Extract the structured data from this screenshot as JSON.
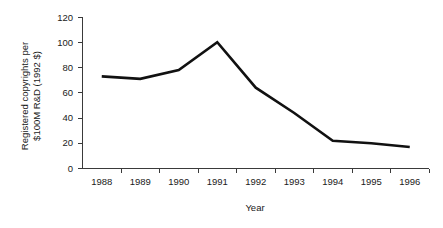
{
  "chart_data": {
    "type": "line",
    "title": "",
    "xlabel": "Year",
    "ylabel": "Registered copyrights per $100M R&D (1992 $)",
    "ylabel_line1": "Registered copyrights per",
    "ylabel_line2": "$100M R&D (1992 $)",
    "categories": [
      "1988",
      "1989",
      "1990",
      "1991",
      "1992",
      "1993",
      "1994",
      "1995",
      "1996"
    ],
    "values": [
      73,
      71,
      78,
      100,
      64,
      44,
      22,
      20,
      17
    ],
    "series": [
      {
        "name": "Registered copyrights per $100M R&D (1992 $)",
        "values": [
          73,
          71,
          78,
          100,
          64,
          44,
          22,
          20,
          17
        ]
      }
    ],
    "ylim": [
      0,
      120
    ],
    "yticks": [
      0,
      20,
      40,
      60,
      80,
      100,
      120
    ],
    "ytick_labels": [
      "0",
      "20",
      "40",
      "60",
      "80",
      "100",
      "120"
    ],
    "xtick_labels": [
      "1988",
      "1989",
      "1990",
      "1991",
      "1992",
      "1993",
      "1994",
      "1995",
      "1996"
    ],
    "grid": false,
    "legend": false,
    "legend_position": "none",
    "line_color": "#111111",
    "axis_color": "#3a3a3a",
    "background_color": "#ffffff",
    "annotations": []
  }
}
